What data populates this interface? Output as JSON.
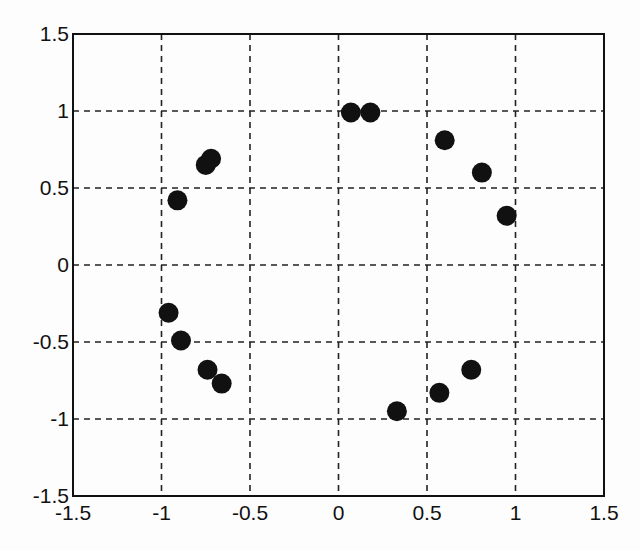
{
  "chart_data": {
    "type": "scatter",
    "title": "",
    "xlabel": "",
    "ylabel": "",
    "xlim": [
      -1.5,
      1.5
    ],
    "ylim": [
      -1.5,
      1.5
    ],
    "grid": true,
    "grid_style": "dashed",
    "legend": null,
    "marker": {
      "shape": "circle",
      "color": "#111111",
      "size": 10
    },
    "x_ticks": [
      -1.5,
      -1,
      -0.5,
      0,
      0.5,
      1,
      1.5
    ],
    "y_ticks": [
      -1.5,
      -1,
      -0.5,
      0,
      0.5,
      1,
      1.5
    ],
    "x_tick_labels": [
      "-1.5",
      "-1",
      "-0.5",
      "0",
      "0.5",
      "1",
      "1.5"
    ],
    "y_tick_labels": [
      "-1.5",
      "-1",
      "-0.5",
      "0",
      "0.5",
      "1",
      "1.5"
    ],
    "series": [
      {
        "name": "points",
        "x": [
          -0.91,
          -0.75,
          -0.72,
          -0.96,
          -0.89,
          -0.74,
          -0.66,
          0.07,
          0.18,
          0.6,
          0.81,
          0.95,
          0.33,
          0.57,
          0.75
        ],
        "y": [
          0.42,
          0.65,
          0.69,
          -0.31,
          -0.49,
          -0.68,
          -0.77,
          0.99,
          0.99,
          0.81,
          0.6,
          0.32,
          -0.95,
          -0.83,
          -0.68
        ]
      }
    ]
  },
  "layout": {
    "plot_left": 73,
    "plot_right": 604,
    "plot_top": 34,
    "plot_bottom": 496,
    "colors": {
      "axis": "#111111",
      "grid": "#222222",
      "marker": "#111111",
      "background": "#fdfdfd"
    }
  }
}
